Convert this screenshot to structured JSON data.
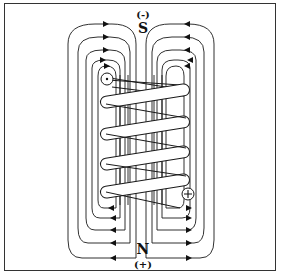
{
  "diagram": {
    "top_polarity": "(-)",
    "top_pole": "S",
    "bottom_pole": "N",
    "bottom_polarity": "(+)",
    "coil_turns": 5,
    "current_in_symbol": "dot",
    "current_out_symbol": "plus",
    "colors": {
      "line": "#1a1a1a",
      "frame": "#333333",
      "background": "#ffffff"
    }
  }
}
